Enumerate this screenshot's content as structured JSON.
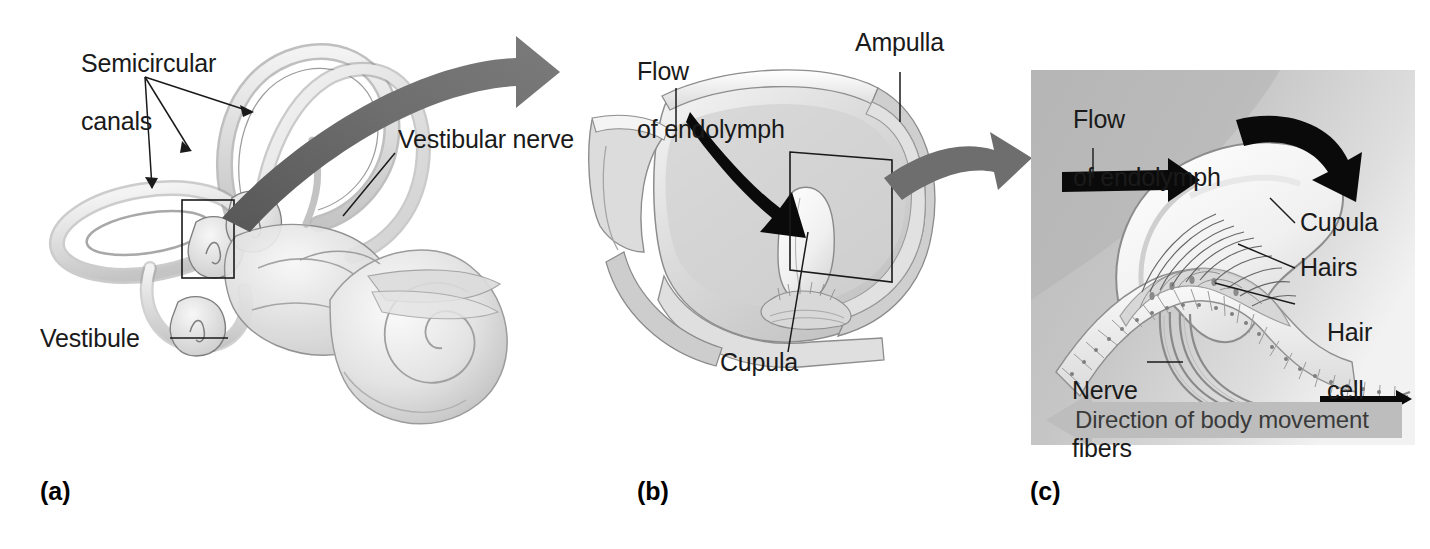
{
  "figure": {
    "type": "anatomical-illustration",
    "panel_count": 3,
    "background_color": "#ffffff",
    "ink_color": "#1a1a1a",
    "transition_arrow_color": "#6e6e6e",
    "flow_arrow_color": "#000000",
    "detail_panel_bg": "#c9c9c9",
    "movement_band_color": "#bdbdbd"
  },
  "panels": [
    {
      "letter": "(a)",
      "name": "inner-ear-overview",
      "labels": [
        {
          "id": "semicircular-canals",
          "text": "Semicircular\ncanals",
          "line1": "Semicircular",
          "line2": "canals"
        },
        {
          "id": "vestibular-nerve",
          "text": "Vestibular nerve"
        },
        {
          "id": "vestibule",
          "text": "Vestibule"
        }
      ]
    },
    {
      "letter": "(b)",
      "name": "ampulla-cutaway",
      "labels": [
        {
          "id": "flow-of-endolymph",
          "text": "Flow\nof endolymph",
          "line1": "Flow",
          "line2": "of endolymph"
        },
        {
          "id": "ampulla",
          "text": "Ampulla"
        },
        {
          "id": "cupula",
          "text": "Cupula"
        }
      ]
    },
    {
      "letter": "(c)",
      "name": "cupula-hair-cell-detail",
      "labels": [
        {
          "id": "flow-of-endolymph",
          "text": "Flow\nof endolymph",
          "line1": "Flow",
          "line2": "of endolymph"
        },
        {
          "id": "cupula",
          "text": "Cupula"
        },
        {
          "id": "hairs",
          "text": "Hairs"
        },
        {
          "id": "hair-cell",
          "text": "Hair\ncell",
          "line1": "Hair",
          "line2": "cell"
        },
        {
          "id": "nerve-fibers",
          "text": "Nerve\nfibers",
          "line1": "Nerve",
          "line2": "fibers"
        },
        {
          "id": "direction-of-body-movement",
          "text": "Direction of body movement"
        }
      ]
    }
  ]
}
